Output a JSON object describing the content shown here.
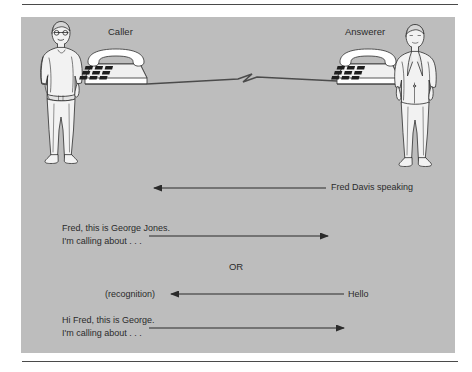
{
  "figure": {
    "panel_color": "#bdbdbd",
    "ink_color": "#2b2b2b",
    "roles": {
      "caller_label": "Caller",
      "answerer_label": "Answerer"
    },
    "connector": {
      "name": "phone-line-zigzag"
    },
    "exchange": [
      {
        "id": "answer-greeting",
        "direction": "right-to-left",
        "right_label": "Fred Davis speaking",
        "left_label": ""
      },
      {
        "id": "caller-formal-open",
        "direction": "left-to-right",
        "left_label_line1": "Fred, this is George Jones.",
        "left_label_line2": "I'm calling about . . .",
        "right_label": ""
      },
      {
        "id": "alternative-separator",
        "label": "OR"
      },
      {
        "id": "answer-hello",
        "direction": "right-to-left",
        "right_label": "Hello",
        "left_label": "(recognition)"
      },
      {
        "id": "caller-informal-open",
        "direction": "left-to-right",
        "left_label_line1": "Hi Fred, this is George.",
        "left_label_line2": "I'm calling about . . .",
        "right_label": ""
      }
    ],
    "speech_block_1": "Fred, this is George Jones.\nI'm calling about . . .",
    "speech_block_2": "Hi Fred, this is George.\nI'm calling about . . ."
  }
}
